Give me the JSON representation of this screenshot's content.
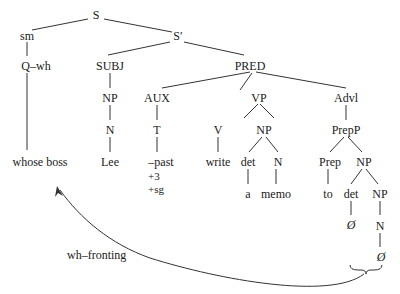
{
  "tree": {
    "nodes": {
      "S": "S",
      "sm": "sm",
      "Sprime": "S′",
      "Qwh": "Q–wh",
      "SUBJ": "SUBJ",
      "PRED": "PRED",
      "NP_subj": "NP",
      "AUX": "AUX",
      "VP": "VP",
      "Advl": "Advl",
      "N_subj": "N",
      "T": "T",
      "V": "V",
      "NP_obj": "NP",
      "PrepP": "PrepP",
      "whose_boss": "whose boss",
      "Lee": "Lee",
      "past": "–past",
      "write": "write",
      "det_obj": "det",
      "N_obj": "N",
      "Prep": "Prep",
      "NP_pp": "NP",
      "a": "a",
      "memo": "memo",
      "to": "to",
      "det_pp": "det",
      "NP_inner": "NP",
      "null_det": "Ø",
      "N_inner": "N",
      "null_n": "Ø"
    },
    "features": [
      "+3",
      "+sg"
    ],
    "movement_label": "wh–fronting"
  }
}
